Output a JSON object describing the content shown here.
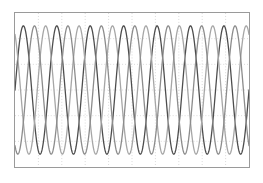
{
  "figure": {
    "background_color": "#ffffff",
    "frame_color": "#9a9a9a",
    "grid_color": "#c9c9c9",
    "grid_style": "dotted",
    "frame": {
      "x": 14,
      "y": 12,
      "width": 236,
      "height": 156
    }
  },
  "chart_data": {
    "type": "line",
    "title": "",
    "subtitle": "",
    "xlabel": "",
    "ylabel": "",
    "xlim": [
      0,
      7
    ],
    "ylim": [
      -1.2,
      1.2
    ],
    "grid": true,
    "grid_columns": 10,
    "grid_rows": 6,
    "xticks": [
      0,
      0.7,
      1.4,
      2.1,
      2.8,
      3.5,
      4.2,
      4.9,
      5.6,
      6.3,
      7
    ],
    "xticklabels": [
      "",
      "",
      "",
      "",
      "",
      "",
      "",
      "",
      "",
      "",
      ""
    ],
    "yticks": [
      -1.2,
      -0.8,
      -0.4,
      0,
      0.4,
      0.8,
      1.2
    ],
    "yticklabels": [
      "",
      "",
      "",
      "",
      "",
      "",
      ""
    ],
    "legend": [],
    "legend_position": "none",
    "annotations": [],
    "waveform": {
      "shape": "sine",
      "cycles": 7,
      "amplitude": 1.0,
      "samples_per_series": 700
    },
    "series": [
      {
        "name": "phase-a",
        "color": "#4d4d4d",
        "line_width": 1.3,
        "phase_degrees": 0,
        "amplitude": 1.0,
        "cycles": 7
      },
      {
        "name": "phase-b",
        "color": "#a6a6a6",
        "line_width": 1.3,
        "phase_degrees": 120,
        "amplitude": 1.0,
        "cycles": 7
      },
      {
        "name": "phase-c",
        "color": "#8c8c8c",
        "line_width": 1.3,
        "phase_degrees": 240,
        "amplitude": 1.0,
        "cycles": 7
      }
    ]
  }
}
